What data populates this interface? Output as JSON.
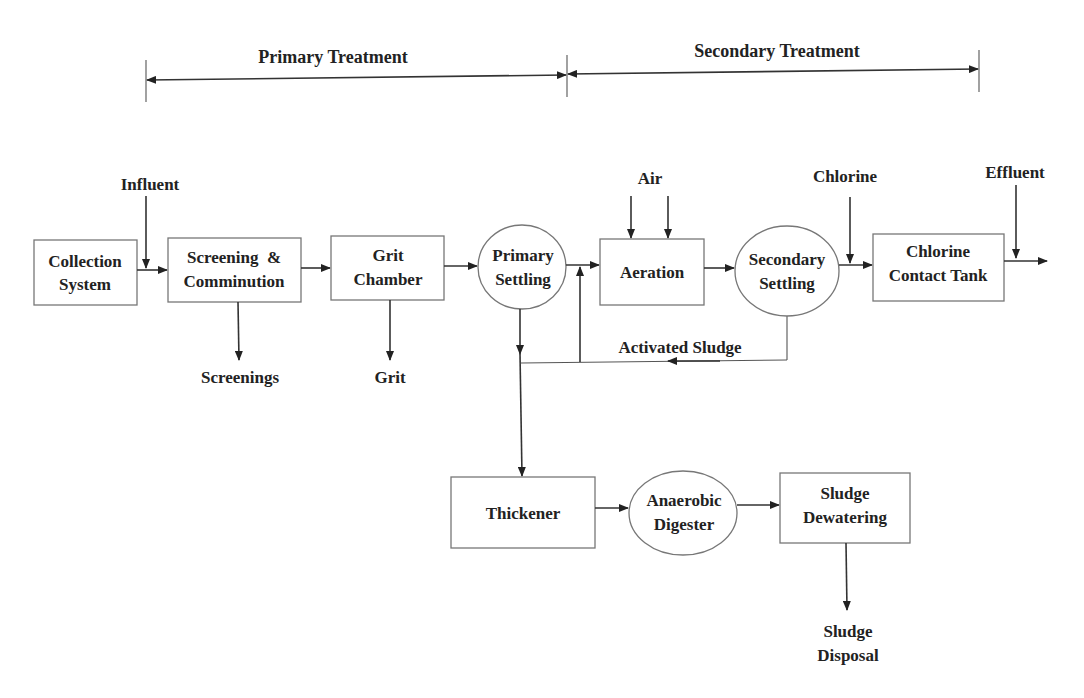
{
  "phases": {
    "primary": {
      "label": "Primary Treatment"
    },
    "secondary": {
      "label": "Secondary Treatment"
    }
  },
  "nodes": {
    "collection": {
      "shape": "box",
      "line1": "Collection",
      "line2": "System"
    },
    "screening": {
      "shape": "box",
      "line1": "Screening  &",
      "line2": "Comminution"
    },
    "grit_chamber": {
      "shape": "box",
      "line1": "Grit",
      "line2": "Chamber"
    },
    "primary_settling": {
      "shape": "ellipse",
      "line1": "Primary",
      "line2": "Settling"
    },
    "aeration": {
      "shape": "box",
      "line1": "Aeration"
    },
    "secondary_settling": {
      "shape": "ellipse",
      "line1": "Secondary",
      "line2": "Settling"
    },
    "chlorine_tank": {
      "shape": "box",
      "line1": "Chlorine",
      "line2": "Contact Tank"
    },
    "thickener": {
      "shape": "box",
      "line1": "Thickener"
    },
    "digester": {
      "shape": "ellipse",
      "line1": "Anaerobic",
      "line2": "Digester"
    },
    "dewatering": {
      "shape": "box",
      "line1": "Sludge",
      "line2": "Dewatering"
    }
  },
  "labels": {
    "influent": "Influent",
    "air": "Air",
    "chlorine": "Chlorine",
    "effluent": "Effluent",
    "screenings": "Screenings",
    "grit": "Grit",
    "activated_sludge": "Activated Sludge",
    "sludge_disposal_line1": "Sludge",
    "sludge_disposal_line2": "Disposal"
  },
  "colors": {
    "line": "#333333",
    "shape_border": "#777777",
    "text": "#222222",
    "background": "#ffffff"
  }
}
